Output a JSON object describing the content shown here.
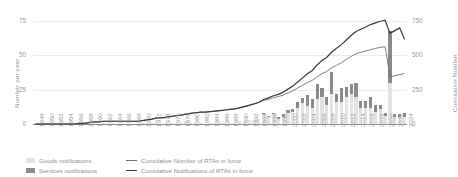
{
  "axes": {
    "left_label": "Number per year",
    "right_label": "Cumulative Number",
    "left_ticks": [
      "0",
      "25",
      "50",
      "75"
    ],
    "right_ticks": [
      "0",
      "250",
      "500",
      "750"
    ]
  },
  "legend": {
    "goods": "Goods notifications",
    "services": "Services notifications",
    "cumulative_rtas": "Cumulative Number of RTAs in force",
    "cumulative_notifications": "Cumulative Notifications of RTAs in force"
  },
  "colors": {
    "goods": "#e3e3e3",
    "services": "#8a8a8a",
    "line_rtas": "#6f6f6f",
    "line_notifications": "#3a3a3a",
    "grid": "#ebebeb",
    "axis": "#8c8c8c",
    "text": "#8f8f8f"
  },
  "chart_data": {
    "type": "bar",
    "title": "",
    "xlabel": "",
    "ylabel": "Number per year",
    "ylim": [
      0,
      75
    ],
    "y2lim": [
      0,
      750
    ],
    "grid": true,
    "legend_position": "bottom",
    "x": [
      1948,
      1949,
      1950,
      1951,
      1952,
      1953,
      1954,
      1955,
      1956,
      1957,
      1958,
      1959,
      1960,
      1961,
      1962,
      1963,
      1964,
      1965,
      1966,
      1967,
      1968,
      1969,
      1970,
      1971,
      1972,
      1973,
      1974,
      1975,
      1976,
      1977,
      1978,
      1979,
      1980,
      1981,
      1982,
      1983,
      1984,
      1985,
      1986,
      1987,
      1988,
      1989,
      1990,
      1991,
      1992,
      1993,
      1994,
      1995,
      1996,
      1997,
      1998,
      1999,
      2000,
      2001,
      2002,
      2003,
      2004,
      2005,
      2006,
      2007,
      2008,
      2009,
      2010,
      2011,
      2012,
      2013,
      2014,
      2015,
      2016,
      2017,
      2018,
      2019,
      2020,
      2021,
      2022,
      2023,
      2024
    ],
    "xtick_labels": [
      "1948",
      "1950",
      "1952",
      "1954",
      "1956",
      "1958",
      "1960",
      "1962",
      "1964",
      "1966",
      "1968",
      "1970",
      "1972",
      "1974",
      "1976",
      "1978",
      "1980",
      "1982",
      "1984",
      "1986",
      "1988",
      "1990",
      "1992",
      "1994",
      "1996",
      "1998",
      "2000",
      "2002",
      "2004",
      "2006",
      "2008",
      "2010",
      "2012",
      "2014",
      "2016",
      "2018",
      "2020",
      "2022",
      "2024"
    ],
    "series": [
      {
        "name": "Goods notifications",
        "type": "bar",
        "stack": "notifications",
        "axis": "left",
        "values": [
          0,
          0,
          0,
          0,
          0,
          0,
          0,
          0,
          0,
          1,
          0,
          1,
          1,
          0,
          1,
          0,
          0,
          0,
          0,
          0,
          0,
          0,
          1,
          1,
          1,
          3,
          0,
          1,
          1,
          1,
          1,
          2,
          1,
          1,
          1,
          0,
          1,
          1,
          1,
          1,
          1,
          1,
          2,
          2,
          3,
          3,
          4,
          7,
          5,
          7,
          4,
          5,
          8,
          9,
          12,
          15,
          13,
          12,
          18,
          20,
          14,
          22,
          16,
          16,
          20,
          22,
          20,
          12,
          12,
          12,
          9,
          11,
          6,
          30,
          5,
          5,
          5
        ]
      },
      {
        "name": "Services notifications",
        "type": "bar",
        "stack": "notifications",
        "axis": "left",
        "values": [
          0,
          0,
          0,
          0,
          0,
          0,
          0,
          0,
          0,
          0,
          0,
          0,
          0,
          0,
          0,
          0,
          0,
          0,
          0,
          0,
          0,
          0,
          0,
          0,
          0,
          0,
          0,
          0,
          0,
          0,
          0,
          0,
          0,
          0,
          0,
          0,
          0,
          0,
          0,
          0,
          0,
          0,
          0,
          0,
          0,
          0,
          0,
          1,
          1,
          1,
          1,
          2,
          2,
          2,
          4,
          4,
          8,
          6,
          11,
          6,
          6,
          16,
          6,
          10,
          7,
          7,
          10,
          5,
          5,
          8,
          5,
          3,
          2,
          38,
          2,
          2,
          3
        ]
      },
      {
        "name": "Cumulative Number of RTAs in force",
        "type": "line",
        "axis": "right",
        "values": [
          0,
          0,
          0,
          0,
          0,
          0,
          0,
          0,
          0,
          5,
          5,
          10,
          15,
          15,
          20,
          20,
          20,
          20,
          20,
          20,
          20,
          20,
          25,
          30,
          35,
          45,
          45,
          50,
          55,
          60,
          65,
          72,
          78,
          82,
          86,
          86,
          90,
          94,
          98,
          102,
          106,
          110,
          118,
          126,
          136,
          146,
          158,
          172,
          180,
          192,
          200,
          210,
          226,
          242,
          262,
          282,
          302,
          318,
          344,
          366,
          384,
          410,
          428,
          446,
          470,
          492,
          512,
          522,
          532,
          542,
          550,
          558,
          562,
          345,
          352,
          360,
          368
        ]
      },
      {
        "name": "Cumulative Notifications of RTAs in force",
        "type": "line",
        "axis": "right",
        "values": [
          0,
          0,
          0,
          0,
          0,
          0,
          0,
          0,
          0,
          5,
          5,
          10,
          15,
          15,
          20,
          20,
          20,
          20,
          20,
          20,
          20,
          20,
          25,
          30,
          35,
          45,
          45,
          50,
          55,
          60,
          65,
          72,
          78,
          82,
          86,
          86,
          90,
          94,
          98,
          102,
          106,
          110,
          118,
          126,
          136,
          146,
          158,
          178,
          190,
          206,
          216,
          232,
          254,
          276,
          306,
          336,
          366,
          390,
          430,
          462,
          486,
          524,
          552,
          578,
          612,
          644,
          674,
          690,
          706,
          724,
          736,
          748,
          756,
          660,
          680,
          700,
          615
        ]
      }
    ],
    "annotations": [
      {
        "note": "Large spike in annual notifications in 2021 reaching about 68 per year"
      }
    ]
  }
}
